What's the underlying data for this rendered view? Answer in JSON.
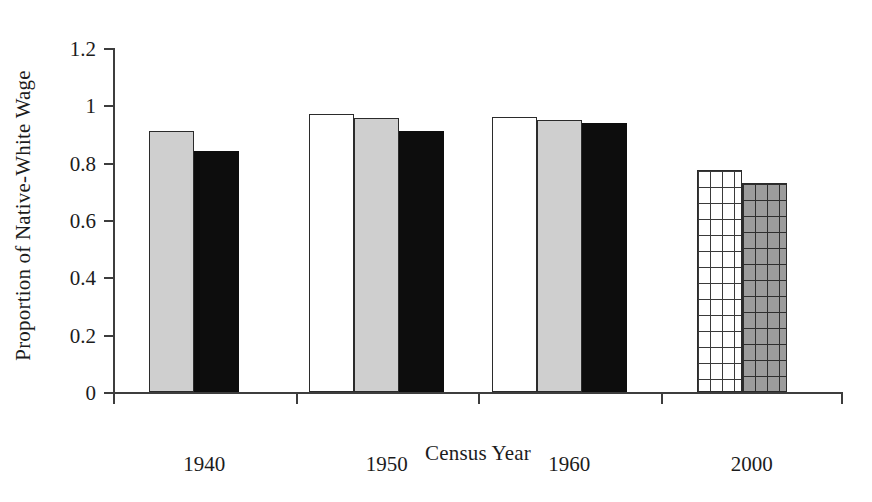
{
  "chart_data": {
    "type": "bar",
    "title": "",
    "xlabel": "Census Year",
    "ylabel": "Proportion of Native-White Wage",
    "categories": [
      "1940",
      "1950",
      "1960",
      "2000"
    ],
    "ylim": [
      0,
      1.2
    ],
    "ytick_labels": [
      "0",
      "0.2",
      "0.4",
      "0.6",
      "0.8",
      "1",
      "1.2"
    ],
    "ytick_values": [
      0,
      0.2,
      0.4,
      0.6,
      0.8,
      1,
      1.2
    ],
    "grid": false,
    "legend_position": "none",
    "series": [
      {
        "name": "series-1",
        "style": "white-outline",
        "values": [
          null,
          0.97,
          0.96,
          null
        ]
      },
      {
        "name": "series-2",
        "style": "light-gray",
        "values": [
          0.91,
          0.955,
          0.95,
          null
        ]
      },
      {
        "name": "series-3",
        "style": "black",
        "values": [
          0.84,
          0.91,
          0.94,
          null
        ]
      },
      {
        "name": "series-4",
        "style": "white-grid",
        "values": [
          null,
          null,
          null,
          0.775
        ]
      },
      {
        "name": "series-5",
        "style": "gray-grid",
        "values": [
          null,
          null,
          null,
          0.73
        ]
      }
    ],
    "colors": {
      "white": "#ffffff",
      "light_gray": "#cfcfcf",
      "black": "#0d0d0d",
      "grid_gray": "#9c9c9c",
      "axis": "#3d3d3d",
      "outline": "#2b2b2b"
    }
  },
  "axis": {
    "y_label": "Proportion of Native-White Wage",
    "x_label": "Census Year",
    "y_ticks": [
      {
        "label": "0",
        "value": 0
      },
      {
        "label": "0.2",
        "value": 0.2
      },
      {
        "label": "0.4",
        "value": 0.4
      },
      {
        "label": "0.6",
        "value": 0.6
      },
      {
        "label": "0.8",
        "value": 0.8
      },
      {
        "label": "1",
        "value": 1
      },
      {
        "label": "1.2",
        "value": 1.2
      }
    ],
    "x_ticks": [
      {
        "label": "1940"
      },
      {
        "label": "1950"
      },
      {
        "label": "1960"
      },
      {
        "label": "2000"
      }
    ]
  }
}
